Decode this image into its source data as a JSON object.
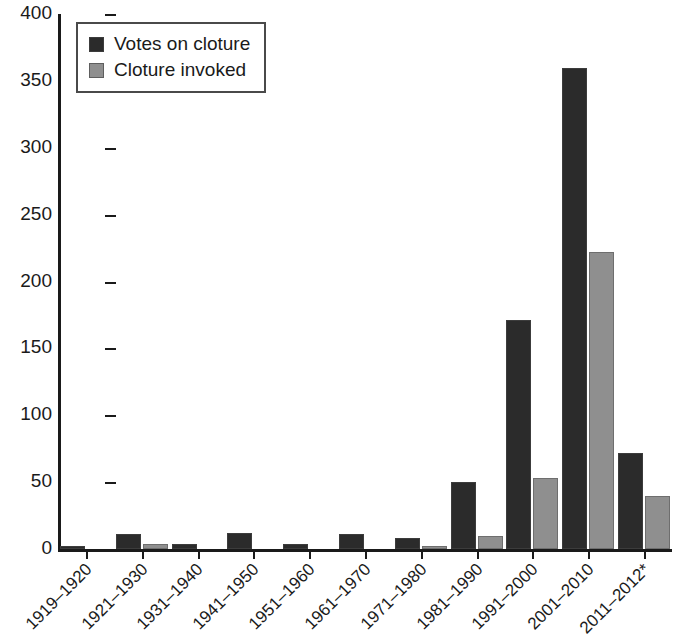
{
  "chart_data": {
    "type": "bar",
    "title": "",
    "subtitle": "",
    "xlabel": "",
    "ylabel": "",
    "ylim": [
      0,
      400
    ],
    "yticks": [
      0,
      50,
      100,
      150,
      200,
      250,
      300,
      350,
      400
    ],
    "grid": false,
    "legend_position": "top-left",
    "categories": [
      "1919–1920",
      "1921–1930",
      "1931–1940",
      "1941–1950",
      "1951–1960",
      "1961–1970",
      "1971–1980",
      "1981–1990",
      "1991–2000",
      "2001–2010",
      "2011–2012*"
    ],
    "series": [
      {
        "name": "Votes on cloture",
        "color": "#2b2b2b",
        "values": [
          2,
          11,
          4,
          12,
          4,
          11,
          8,
          50,
          171,
          360,
          72
        ]
      },
      {
        "name": "Cloture invoked",
        "color": "#8f8f8f",
        "values": [
          0,
          4,
          0,
          0,
          0,
          0,
          2,
          10,
          53,
          222,
          40
        ]
      }
    ]
  },
  "legend": {
    "items": [
      {
        "label": "Votes on cloture",
        "swatch": "dark"
      },
      {
        "label": "Cloture invoked",
        "swatch": "light"
      }
    ]
  }
}
